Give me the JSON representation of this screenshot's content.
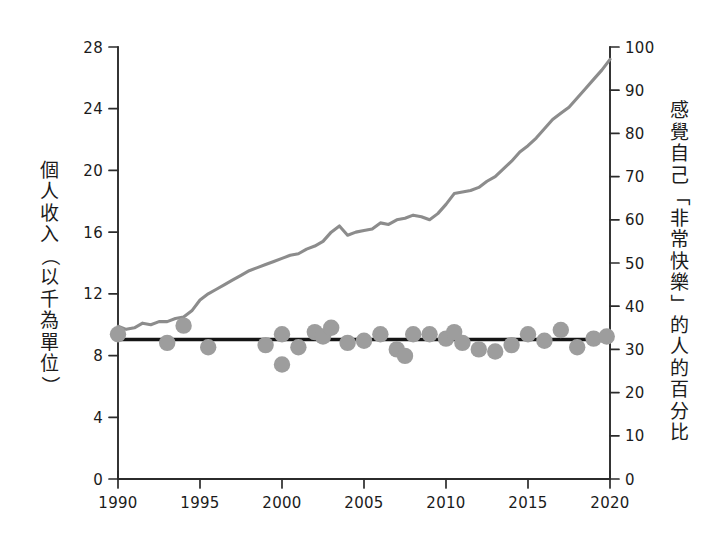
{
  "chart_data": {
    "type": "line",
    "title": "",
    "subtitle": "",
    "xlabel": "",
    "ylabel": "個人收入（以千為單位）",
    "y2label": "感覺自己「非常快樂」的人的百分比",
    "grid": false,
    "legend": "none",
    "xlim": [
      1990,
      2020
    ],
    "ylim": [
      0,
      28
    ],
    "y2lim": [
      0,
      100
    ],
    "xticks": [
      1990,
      1995,
      2000,
      2005,
      2010,
      2015,
      2020
    ],
    "xtick_labels": [
      "1990",
      "1995",
      "2000",
      "2005",
      "2010",
      "2015",
      "2020"
    ],
    "yticks": [
      0,
      4,
      8,
      12,
      16,
      20,
      24,
      28
    ],
    "ytick_labels": [
      "0",
      "4",
      "8",
      "12",
      "16",
      "20",
      "24",
      "28"
    ],
    "y2ticks": [
      0,
      10,
      20,
      30,
      40,
      50,
      60,
      70,
      80,
      90,
      100
    ],
    "y2tick_labels": [
      "0",
      "10",
      "20",
      "30",
      "40",
      "50",
      "60",
      "70",
      "80",
      "90",
      "100"
    ],
    "series": [
      {
        "name": "個人收入（以千為單位）",
        "type": "line",
        "axis": "left",
        "color": "#8c8c8c",
        "x": [
          1990.0,
          1990.5,
          1991.0,
          1991.5,
          1992.0,
          1992.5,
          1993.0,
          1993.5,
          1994.0,
          1994.5,
          1995.0,
          1995.5,
          1996.0,
          1996.5,
          1997.0,
          1997.5,
          1998.0,
          1998.5,
          1999.0,
          1999.5,
          2000.0,
          2000.5,
          2001.0,
          2001.5,
          2002.0,
          2002.5,
          2003.0,
          2003.5,
          2004.0,
          2004.5,
          2005.0,
          2005.5,
          2006.0,
          2006.5,
          2007.0,
          2007.5,
          2008.0,
          2008.5,
          2009.0,
          2009.5,
          2010.0,
          2010.5,
          2011.0,
          2011.5,
          2012.0,
          2012.5,
          2013.0,
          2013.5,
          2014.0,
          2014.5,
          2015.0,
          2015.5,
          2016.0,
          2016.5,
          2017.0,
          2017.5,
          2018.0,
          2018.5,
          2019.0,
          2019.5,
          2020.0
        ],
        "y": [
          9.9,
          9.7,
          9.8,
          10.1,
          10.0,
          10.2,
          10.2,
          10.4,
          10.5,
          10.9,
          11.6,
          12.0,
          12.3,
          12.6,
          12.9,
          13.2,
          13.5,
          13.7,
          13.9,
          14.1,
          14.3,
          14.5,
          14.6,
          14.9,
          15.1,
          15.4,
          16.0,
          16.4,
          15.8,
          16.0,
          16.1,
          16.2,
          16.6,
          16.5,
          16.8,
          16.9,
          17.1,
          17.0,
          16.8,
          17.2,
          17.8,
          18.5,
          18.6,
          18.7,
          18.9,
          19.3,
          19.6,
          20.1,
          20.6,
          21.2,
          21.6,
          22.1,
          22.7,
          23.3,
          23.7,
          24.1,
          24.7,
          25.3,
          25.9,
          26.5,
          27.2
        ]
      },
      {
        "name": "感覺自己「非常快樂」的人的百分比",
        "type": "scatter",
        "axis": "right",
        "color": "#9d9d9d",
        "x": [
          1990,
          1993,
          1994,
          1995.5,
          1999,
          2000,
          2000,
          2001,
          2002,
          2002.5,
          2003,
          2004,
          2005,
          2006,
          2007,
          2007.5,
          2008,
          2009,
          2010,
          2010.5,
          2011,
          2012,
          2013,
          2014,
          2015,
          2016,
          2017,
          2018,
          2019,
          2019.8
        ],
        "y": [
          33.5,
          31.5,
          35.5,
          30.5,
          31.0,
          33.5,
          26.5,
          30.5,
          34.0,
          33.0,
          35.0,
          31.5,
          32.0,
          33.5,
          30.0,
          28.5,
          33.5,
          33.5,
          32.5,
          34.0,
          31.5,
          30.0,
          29.5,
          31.0,
          33.5,
          32.0,
          34.5,
          30.5,
          32.5,
          33.0
        ]
      },
      {
        "name": "快樂趨勢線",
        "type": "trend-line",
        "axis": "right",
        "color": "#151515",
        "x": [
          1990,
          2020
        ],
        "y": [
          32.3,
          32.3
        ]
      }
    ],
    "annotations": []
  },
  "axis_titles": {
    "left_chars": [
      "個",
      "人",
      "收",
      "入",
      "（",
      "以",
      "千",
      "為",
      "單",
      "位",
      "）"
    ],
    "right_chars": [
      "感",
      "覺",
      "自",
      "己",
      "「",
      "非",
      "常",
      "快",
      "樂",
      "」",
      "的",
      "人",
      "的",
      "百",
      "分",
      "比"
    ]
  },
  "colors": {
    "background": "#ffffff",
    "axis": "#2b2b2b",
    "income_line": "#8c8c8c",
    "dot": "#9d9d9d",
    "trend_line": "#151515",
    "text": "#1b1b1b"
  }
}
